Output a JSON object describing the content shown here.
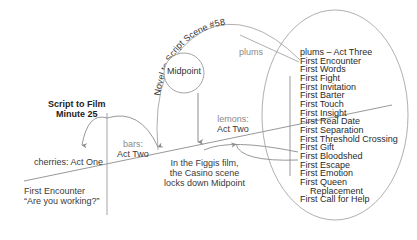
{
  "diagram": {
    "arc_label": "Novel to Script Scene #58",
    "midpoint_node": "Midpoint",
    "script_to_film": {
      "line1": "Script to Film",
      "line2": "Minute 25"
    },
    "plums_label": "plums",
    "cherries_label": "cherries: Act One",
    "bars_label": {
      "line1": "bars:",
      "line2": "Act Two"
    },
    "lemons_label": {
      "line1": "lemons:",
      "line2": "Act Two"
    },
    "figgis_note": {
      "line1": "In the Figgis film,",
      "line2": "the Casino scene",
      "line3": "locks down Midpoint"
    },
    "first_encounter_note": {
      "line1": "First Encounter",
      "line2": "“Are you working?”"
    },
    "act_three_list": {
      "header": "plums – Act Three",
      "items": [
        "First Encounter",
        "First Words",
        "First Fight",
        "First Invitation",
        "First Barter",
        "First Touch",
        "First Insight",
        "First Real Date",
        "First Separation",
        "First Threshold Crossing",
        "First Gift",
        "First Bloodshed",
        "First Escape",
        "First Emotion",
        "First Queen",
        "Replacement",
        "First Call for Help"
      ]
    },
    "colors": {
      "line": "#8c8c8c",
      "text": "#333333",
      "muted": "#8a8a8a",
      "background": "#ffffff"
    }
  }
}
